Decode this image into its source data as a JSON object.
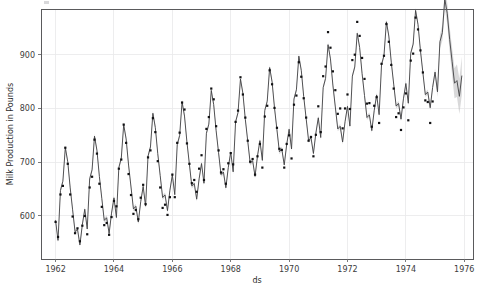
{
  "figure": {
    "width": 488,
    "height": 296,
    "background_color": "#ffffff",
    "plot_area": {
      "left": 41,
      "top": 9,
      "right": 473,
      "bottom": 259
    }
  },
  "chart_data": {
    "type": "line",
    "title": "",
    "xlabel": "ds",
    "ylabel": "Milk Production in Pounds",
    "xlim": [
      1961.5,
      1976.3
    ],
    "ylim": [
      520,
      985
    ],
    "xticks": [
      1962,
      1964,
      1966,
      1968,
      1970,
      1972,
      1974,
      1976
    ],
    "xtick_labels": [
      "1962",
      "1964",
      "1966",
      "1968",
      "1970",
      "1972",
      "1974",
      "1976"
    ],
    "yticks": [
      600,
      700,
      800,
      900
    ],
    "ytick_labels": [
      "600",
      "700",
      "800",
      "900"
    ],
    "grid": true,
    "legend": null,
    "colors": {
      "forecast_line": "#3f3f42",
      "observed_points": "#111113",
      "uncertainty_band": "#b9b9bb",
      "grid": "#e9e9ea",
      "spine": "#5a5a5c",
      "text": "#3c3c3c"
    },
    "series": [
      {
        "name": "y",
        "kind": "observed-points",
        "x_start": 1962.0,
        "x_step": 0.08333333,
        "values": [
          589,
          561,
          640,
          656,
          727,
          697,
          640,
          599,
          568,
          577,
          553,
          582,
          600,
          566,
          653,
          673,
          742,
          716,
          660,
          617,
          583,
          587,
          565,
          598,
          628,
          618,
          688,
          705,
          770,
          736,
          678,
          639,
          604,
          611,
          594,
          634,
          658,
          622,
          709,
          722,
          782,
          756,
          702,
          653,
          615,
          621,
          602,
          635,
          677,
          635,
          736,
          755,
          811,
          798,
          735,
          697,
          661,
          667,
          645,
          688,
          713,
          667,
          762,
          784,
          837,
          817,
          767,
          722,
          681,
          687,
          660,
          698,
          717,
          696,
          775,
          796,
          858,
          826,
          783,
          740,
          701,
          706,
          677,
          711,
          734,
          690,
          785,
          805,
          871,
          845,
          801,
          764,
          725,
          723,
          690,
          734,
          750,
          707,
          807,
          824,
          886,
          859,
          819,
          783,
          740,
          747,
          711,
          751,
          804,
          756,
          860,
          878,
          942,
          913,
          869,
          834,
          790,
          800,
          763,
          800,
          826,
          799,
          890,
          900,
          961,
          935,
          894,
          855,
          809,
          810,
          766,
          805,
          821,
          773,
          883,
          898,
          957,
          924,
          881,
          837,
          784,
          791,
          760,
          802,
          828,
          778,
          889,
          902,
          969,
          947,
          908,
          867,
          815,
          812,
          773,
          813
        ]
      },
      {
        "name": "yhat",
        "kind": "forecast-line",
        "x_start": 1962.0,
        "x_step": 0.08333333,
        "comment": "fitted + forecast; extends one year past observed data into 1976"
      }
    ],
    "observed_range": [
      "1962",
      "1975"
    ],
    "forecast_extends_to": "1976"
  },
  "axes": {
    "x_axis": {
      "label": "ds",
      "name": "x-axis"
    },
    "y_axis": {
      "label": "Milk Production in Pounds",
      "name": "y-axis"
    }
  }
}
